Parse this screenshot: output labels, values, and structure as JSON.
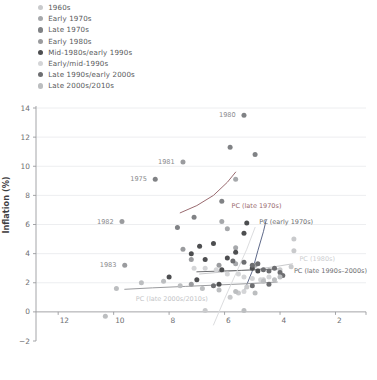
{
  "chart_data": {
    "type": "scatter",
    "title": "",
    "xlabel": "",
    "ylabel": "Inflation (%)",
    "xlim": [
      12.8,
      0.9
    ],
    "ylim": [
      -2,
      14
    ],
    "x_reversed": true,
    "xticks": [
      12,
      10,
      8,
      6,
      4,
      2
    ],
    "yticks": [
      -2,
      0,
      2,
      4,
      6,
      8,
      10,
      12,
      14
    ],
    "grid": "horizontal",
    "legend_position": "top-left",
    "series": [
      {
        "name": "1960s",
        "color": "#c9cacc",
        "points": [
          {
            "x": 6.7,
            "y": 0.1
          },
          {
            "x": 5.8,
            "y": 1.0
          },
          {
            "x": 5.5,
            "y": 1.3
          },
          {
            "x": 5.2,
            "y": 1.7
          },
          {
            "x": 4.6,
            "y": 2.2
          },
          {
            "x": 4.0,
            "y": 2.9
          },
          {
            "x": 3.6,
            "y": 3.1
          },
          {
            "x": 3.5,
            "y": 4.2
          },
          {
            "x": 3.5,
            "y": 5.0
          }
        ]
      },
      {
        "name": "Early 1970s",
        "color": "#a6a8ab",
        "points": [
          {
            "x": 5.9,
            "y": 5.7
          },
          {
            "x": 5.6,
            "y": 4.4
          },
          {
            "x": 4.9,
            "y": 3.2
          },
          {
            "x": 5.6,
            "y": 3.3
          },
          {
            "x": 6.1,
            "y": 6.2
          },
          {
            "x": 5.6,
            "y": 9.1
          }
        ]
      },
      {
        "name": "Late 1970s",
        "color": "#808285",
        "points": [
          {
            "x": 8.5,
            "y": 9.1
          },
          {
            "x": 7.7,
            "y": 5.8
          },
          {
            "x": 7.1,
            "y": 6.5
          },
          {
            "x": 6.1,
            "y": 7.6
          },
          {
            "x": 5.8,
            "y": 11.3
          },
          {
            "x": 5.3,
            "y": 13.5
          },
          {
            "x": 4.9,
            "y": 10.8
          }
        ]
      },
      {
        "name": "Early 1980s",
        "color": "#9a9b9e",
        "points": [
          {
            "x": 9.7,
            "y": 6.2
          },
          {
            "x": 9.6,
            "y": 3.2
          },
          {
            "x": 7.5,
            "y": 10.3
          },
          {
            "x": 7.5,
            "y": 4.3
          },
          {
            "x": 7.2,
            "y": 3.6
          },
          {
            "x": 6.2,
            "y": 3.2
          },
          {
            "x": 7.2,
            "y": 1.9
          }
        ]
      },
      {
        "name": "Mid-1980s/early 1990s",
        "color": "#4d4e50",
        "points": [
          {
            "x": 7.2,
            "y": 4.0
          },
          {
            "x": 6.9,
            "y": 4.5
          },
          {
            "x": 6.7,
            "y": 3.6
          },
          {
            "x": 6.4,
            "y": 4.7
          },
          {
            "x": 6.1,
            "y": 2.9
          },
          {
            "x": 5.9,
            "y": 3.7
          },
          {
            "x": 5.6,
            "y": 4.1
          },
          {
            "x": 5.3,
            "y": 5.4
          },
          {
            "x": 5.2,
            "y": 6.1
          },
          {
            "x": 5.0,
            "y": 3.0
          },
          {
            "x": 4.8,
            "y": 2.8
          },
          {
            "x": 8.0,
            "y": 2.4
          },
          {
            "x": 7.0,
            "y": 2.2
          },
          {
            "x": 6.2,
            "y": 1.9
          }
        ]
      },
      {
        "name": "Early/mid-1990s",
        "color": "#d4d5d7",
        "points": [
          {
            "x": 6.7,
            "y": 3.0
          },
          {
            "x": 6.3,
            "y": 2.9
          },
          {
            "x": 5.9,
            "y": 2.6
          },
          {
            "x": 5.5,
            "y": 2.6
          },
          {
            "x": 5.3,
            "y": 2.4
          },
          {
            "x": 5.0,
            "y": 2.3
          },
          {
            "x": 4.7,
            "y": 2.2
          },
          {
            "x": 4.4,
            "y": 2.4
          },
          {
            "x": 7.1,
            "y": 3.0
          },
          {
            "x": 5.3,
            "y": 1.4
          }
        ]
      },
      {
        "name": "Late 1990s/early 2000s",
        "color": "#6d6e71",
        "points": [
          {
            "x": 5.7,
            "y": 3.5
          },
          {
            "x": 5.3,
            "y": 3.4
          },
          {
            "x": 5.0,
            "y": 3.2
          },
          {
            "x": 4.8,
            "y": 3.3
          },
          {
            "x": 4.6,
            "y": 2.9
          },
          {
            "x": 4.4,
            "y": 2.8
          },
          {
            "x": 4.2,
            "y": 3.0
          },
          {
            "x": 4.0,
            "y": 2.7
          },
          {
            "x": 3.9,
            "y": 2.5
          },
          {
            "x": 6.4,
            "y": 1.8
          },
          {
            "x": 5.0,
            "y": 1.8
          },
          {
            "x": 4.4,
            "y": 1.9
          }
        ]
      },
      {
        "name": "Late 2000s/2010s",
        "color": "#bcbec0",
        "points": [
          {
            "x": 10.3,
            "y": -0.3
          },
          {
            "x": 9.9,
            "y": 1.6
          },
          {
            "x": 9.0,
            "y": 2.0
          },
          {
            "x": 8.2,
            "y": 2.1
          },
          {
            "x": 7.6,
            "y": 1.8
          },
          {
            "x": 6.8,
            "y": 1.6
          },
          {
            "x": 6.2,
            "y": 1.5
          },
          {
            "x": 5.6,
            "y": 1.4
          },
          {
            "x": 5.3,
            "y": 0.1
          },
          {
            "x": 4.9,
            "y": 1.3
          },
          {
            "x": 4.6,
            "y": 2.1
          },
          {
            "x": 4.2,
            "y": 2.2
          },
          {
            "x": 4.0,
            "y": 2.4
          }
        ]
      }
    ],
    "point_labels": [
      {
        "text": "1980",
        "x": 5.3,
        "y": 13.5
      },
      {
        "text": "1981",
        "x": 7.5,
        "y": 10.3
      },
      {
        "text": "1975",
        "x": 8.5,
        "y": 9.1
      },
      {
        "text": "1982",
        "x": 9.7,
        "y": 6.2
      },
      {
        "text": "1983",
        "x": 9.6,
        "y": 3.2
      }
    ],
    "curves": [
      {
        "name": "PC (late 1970s)",
        "label": "PC (late 1970s)",
        "color": "#9a6b70",
        "label_color": "#9a6b70",
        "label_x": 5.75,
        "label_y": 7.3,
        "path": [
          [
            7.6,
            6.8
          ],
          [
            7.0,
            7.3
          ],
          [
            6.4,
            8.0
          ],
          [
            5.9,
            8.9
          ],
          [
            5.6,
            9.6
          ]
        ]
      },
      {
        "name": "PC (early 1970s)",
        "label": "PC (early 1970s)",
        "color": "#5f6a8a",
        "label_color": "#6d6e71",
        "label_x": 4.75,
        "label_y": 6.2,
        "path": [
          [
            5.3,
            1.4
          ],
          [
            5.0,
            2.8
          ],
          [
            4.8,
            4.2
          ],
          [
            4.6,
            5.5
          ],
          [
            4.5,
            6.3
          ]
        ]
      },
      {
        "name": "PC (1980s)",
        "label": "PC (1980s)",
        "color": "#c9cacc",
        "label_color": "#cdced0",
        "label_x": 3.3,
        "label_y": 3.6,
        "path": [
          [
            6.9,
            2.6
          ],
          [
            6.0,
            2.75
          ],
          [
            5.0,
            2.9
          ],
          [
            4.2,
            3.1
          ],
          [
            3.55,
            3.3
          ]
        ]
      },
      {
        "name": "PC (late 1990s-2000s)",
        "label": "PC (late 1990s–2000s)",
        "color": "#6d6e71",
        "label_color": "#6d6e71",
        "label_x": 3.5,
        "label_y": 2.8,
        "path": [
          [
            7.0,
            2.75
          ],
          [
            6.2,
            2.8
          ],
          [
            5.4,
            2.85
          ],
          [
            4.7,
            2.9
          ],
          [
            4.1,
            2.95
          ]
        ]
      },
      {
        "name": "PC (late 2000s/2010s)",
        "label": "PC (late 2000s/2010s)",
        "color": "#9a9b9e",
        "label_color": "#c4c5c7",
        "label_x": 9.2,
        "label_y": 0.9,
        "path": [
          [
            9.6,
            1.55
          ],
          [
            8.6,
            1.65
          ],
          [
            7.4,
            1.75
          ],
          [
            6.2,
            1.85
          ],
          [
            5.0,
            1.95
          ],
          [
            4.1,
            2.05
          ]
        ]
      },
      {
        "name": "vertical-light-line",
        "label": "",
        "color": "#dcdddf",
        "label_color": "#dcdddf",
        "label_x": 0,
        "label_y": 0,
        "path": [
          [
            6.4,
            -0.9
          ],
          [
            6.0,
            0.9
          ],
          [
            5.6,
            2.6
          ],
          [
            5.2,
            4.3
          ],
          [
            4.9,
            5.8
          ]
        ]
      }
    ]
  },
  "legend": {
    "items": [
      {
        "label": "1960s",
        "color": "#c9cacc"
      },
      {
        "label": "Early 1970s",
        "color": "#a6a8ab"
      },
      {
        "label": "Late 1970s",
        "color": "#808285"
      },
      {
        "label": "Early 1980s",
        "color": "#9a9b9e"
      },
      {
        "label": "Mid-1980s/early 1990s",
        "color": "#4d4e50"
      },
      {
        "label": "Early/mid-1990s",
        "color": "#d4d5d7"
      },
      {
        "label": "Late 1990s/early 2000s",
        "color": "#6d6e71"
      },
      {
        "label": "Late 2000s/2010s",
        "color": "#bcbec0"
      }
    ]
  },
  "axes": {
    "y_title": "Inflation (%)",
    "y_ticks": [
      "14",
      "12",
      "10",
      "8",
      "6",
      "4",
      "2",
      "0",
      "−2"
    ],
    "x_ticks": [
      "12",
      "10",
      "8",
      "6",
      "4",
      "2"
    ]
  }
}
